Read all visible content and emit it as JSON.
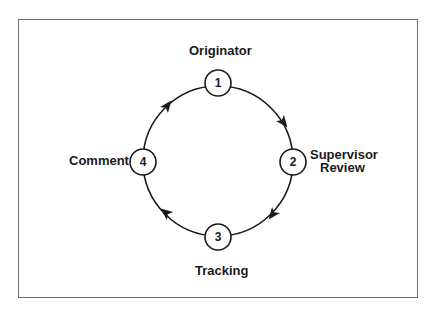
{
  "diagram": {
    "type": "cycle",
    "nodes": [
      {
        "number": "1",
        "label": "Originator"
      },
      {
        "number": "2",
        "label_line1": "Supervisor",
        "label_line2": "Review"
      },
      {
        "number": "3",
        "label": "Tracking"
      },
      {
        "number": "4",
        "label": "Comment"
      }
    ],
    "edges": [
      {
        "from": "1",
        "to": "2",
        "direction": "clockwise"
      },
      {
        "from": "2",
        "to": "3",
        "direction": "clockwise"
      },
      {
        "from": "3",
        "to": "4",
        "direction": "clockwise"
      },
      {
        "from": "4",
        "to": "1",
        "direction": "clockwise"
      }
    ],
    "colors": {
      "stroke": "#1a1a1a",
      "frame": "#6e6e6e",
      "background": "#ffffff"
    }
  }
}
